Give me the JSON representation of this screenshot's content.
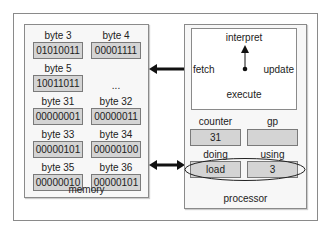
{
  "memory": {
    "title": "memory",
    "ellipsis": "...",
    "bytes": [
      {
        "label": "byte 3",
        "value": "01010011"
      },
      {
        "label": "byte 4",
        "value": "00001111"
      },
      {
        "label": "byte 5",
        "value": "10011011"
      },
      {
        "label": "byte 31",
        "value": "00000001"
      },
      {
        "label": "byte 32",
        "value": "00000011"
      },
      {
        "label": "byte 33",
        "value": "00000101"
      },
      {
        "label": "byte 34",
        "value": "00000100"
      },
      {
        "label": "byte 35",
        "value": "00000010"
      },
      {
        "label": "byte 36",
        "value": "00000101"
      }
    ]
  },
  "processor": {
    "title": "processor",
    "cycle": {
      "top": "interpret",
      "left": "fetch",
      "right": "update",
      "bottom": "execute"
    },
    "registers": {
      "counter": {
        "label": "counter",
        "value": "31"
      },
      "gp": {
        "label": "gp",
        "value": ""
      },
      "doing": {
        "label": "doing",
        "value": "load"
      },
      "using": {
        "label": "using",
        "value": "3"
      }
    }
  },
  "colors": {
    "cell_fill": "#d4d4d4",
    "border": "#8a8a8a",
    "arrow": "#111111"
  }
}
